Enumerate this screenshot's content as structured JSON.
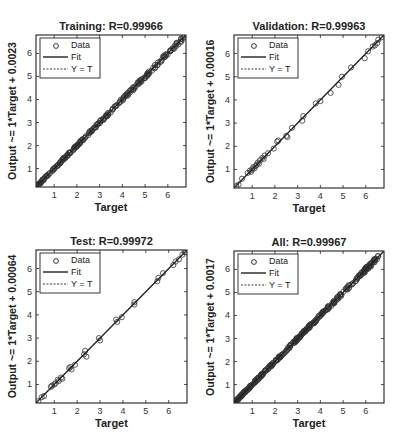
{
  "chart_data": [
    {
      "type": "scatter",
      "title": "Training: R=0.99966",
      "xlabel": "Target",
      "ylabel": "Output ~= 1*Target + 0.0023",
      "xlim": [
        0.2,
        6.8
      ],
      "ylim": [
        0.2,
        6.8
      ],
      "xticks": [
        1,
        2,
        3,
        4,
        5,
        6
      ],
      "yticks": [
        1,
        2,
        3,
        4,
        5,
        6
      ],
      "fit": {
        "slope": 1,
        "intercept": 0.0023
      },
      "density": "dense",
      "n_points": 220,
      "seed": 11,
      "noise": 0.05,
      "legend": [
        "Data",
        "Fit",
        "Y = T"
      ],
      "box": {
        "x": 36,
        "y": 35,
        "w": 150,
        "h": 152
      }
    },
    {
      "type": "scatter",
      "title": "Validation: R=0.99963",
      "xlabel": "Target",
      "ylabel": "Output ~= 1*Target + 0.00016",
      "xlim": [
        0.2,
        6.8
      ],
      "ylim": [
        0.2,
        6.8
      ],
      "xticks": [
        1,
        2,
        3,
        4,
        5,
        6
      ],
      "yticks": [
        1,
        2,
        3,
        4,
        5,
        6
      ],
      "fit": {
        "slope": 1,
        "intercept": 0.00016
      },
      "points": [
        [
          0.3,
          0.28
        ],
        [
          0.4,
          0.35
        ],
        [
          0.55,
          0.6
        ],
        [
          0.8,
          0.85
        ],
        [
          0.9,
          0.95
        ],
        [
          0.95,
          0.9
        ],
        [
          1.0,
          1.0
        ],
        [
          1.05,
          1.1
        ],
        [
          1.1,
          1.05
        ],
        [
          1.15,
          1.15
        ],
        [
          1.2,
          1.2
        ],
        [
          1.25,
          1.3
        ],
        [
          1.3,
          1.25
        ],
        [
          1.35,
          1.4
        ],
        [
          1.45,
          1.5
        ],
        [
          1.5,
          1.45
        ],
        [
          1.55,
          1.6
        ],
        [
          1.7,
          1.7
        ],
        [
          1.95,
          1.9
        ],
        [
          2.1,
          2.2
        ],
        [
          2.15,
          2.25
        ],
        [
          2.5,
          2.45
        ],
        [
          2.55,
          2.4
        ],
        [
          2.75,
          2.8
        ],
        [
          3.2,
          3.1
        ],
        [
          3.25,
          3.3
        ],
        [
          3.8,
          3.85
        ],
        [
          4.0,
          3.95
        ],
        [
          4.45,
          4.3
        ],
        [
          4.8,
          4.65
        ],
        [
          4.95,
          5.0
        ],
        [
          5.35,
          5.4
        ],
        [
          5.95,
          5.8
        ],
        [
          6.1,
          6.1
        ],
        [
          6.3,
          6.3
        ],
        [
          6.4,
          6.35
        ],
        [
          6.5,
          6.45
        ],
        [
          6.55,
          6.6
        ],
        [
          6.7,
          6.7
        ]
      ],
      "legend": [
        "Data",
        "Fit",
        "Y = T"
      ],
      "box": {
        "x": 234,
        "y": 35,
        "w": 150,
        "h": 153
      }
    },
    {
      "type": "scatter",
      "title": "Test: R=0.99972",
      "xlabel": "Target",
      "ylabel": "Output ~= 1*Target + 0.00064",
      "xlim": [
        0.2,
        6.8
      ],
      "ylim": [
        0.2,
        6.8
      ],
      "xticks": [
        1,
        2,
        3,
        4,
        5,
        6
      ],
      "yticks": [
        1,
        2,
        3,
        4,
        5,
        6
      ],
      "fit": {
        "slope": 1,
        "intercept": 0.00064
      },
      "points": [
        [
          0.3,
          0.28
        ],
        [
          0.45,
          0.45
        ],
        [
          0.55,
          0.5
        ],
        [
          0.85,
          0.9
        ],
        [
          0.9,
          0.95
        ],
        [
          1.0,
          1.0
        ],
        [
          1.05,
          1.05
        ],
        [
          1.15,
          1.2
        ],
        [
          1.2,
          1.15
        ],
        [
          1.3,
          1.3
        ],
        [
          1.35,
          1.25
        ],
        [
          1.65,
          1.7
        ],
        [
          1.7,
          1.75
        ],
        [
          1.75,
          1.65
        ],
        [
          1.9,
          1.85
        ],
        [
          2.3,
          2.3
        ],
        [
          2.35,
          2.45
        ],
        [
          2.4,
          2.2
        ],
        [
          2.95,
          3.0
        ],
        [
          3.0,
          2.9
        ],
        [
          3.7,
          3.8
        ],
        [
          3.75,
          3.7
        ],
        [
          3.95,
          3.9
        ],
        [
          4.5,
          4.55
        ],
        [
          4.5,
          4.45
        ],
        [
          5.5,
          5.45
        ],
        [
          5.55,
          5.6
        ],
        [
          5.75,
          5.8
        ],
        [
          6.2,
          6.15
        ],
        [
          6.3,
          6.3
        ],
        [
          6.45,
          6.4
        ],
        [
          6.6,
          6.6
        ],
        [
          6.7,
          6.72
        ],
        [
          6.75,
          6.7
        ]
      ],
      "legend": [
        "Data",
        "Fit",
        "Y = T"
      ],
      "box": {
        "x": 36,
        "y": 250,
        "w": 151,
        "h": 153
      }
    },
    {
      "type": "scatter",
      "title": "All: R=0.99967",
      "xlabel": "Target",
      "ylabel": "Output ~= 1*Target + 0.0017",
      "xlim": [
        0.2,
        6.8
      ],
      "ylim": [
        0.2,
        6.8
      ],
      "xticks": [
        1,
        2,
        3,
        4,
        5,
        6
      ],
      "yticks": [
        1,
        2,
        3,
        4,
        5,
        6
      ],
      "fit": {
        "slope": 1,
        "intercept": 0.0017
      },
      "density": "very dense",
      "n_points": 320,
      "seed": 29,
      "noise": 0.05,
      "legend": [
        "Data",
        "Fit",
        "Y = T"
      ],
      "box": {
        "x": 234,
        "y": 251,
        "w": 150,
        "h": 152
      }
    }
  ]
}
